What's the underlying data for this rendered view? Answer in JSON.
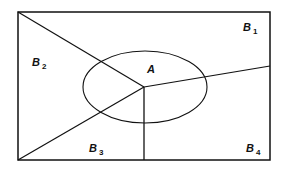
{
  "diagram": {
    "type": "venn-partition",
    "stroke_color": "#111111",
    "background": "#ffffff",
    "rectangle": {
      "x1": 18,
      "y1": 12,
      "x2": 270,
      "y2": 160
    },
    "ellipse": {
      "cx": 145,
      "cy": 87,
      "rx": 62,
      "ry": 36
    },
    "center_point": {
      "x": 144,
      "y": 87
    },
    "partition_lines": [
      {
        "name": "B1-B2 boundary",
        "from": [
          144,
          87
        ],
        "to": [
          18,
          12
        ]
      },
      {
        "name": "B2-B3 boundary",
        "from": [
          144,
          87
        ],
        "to": [
          18,
          160
        ]
      },
      {
        "name": "B3-B4 boundary",
        "from": [
          144,
          87
        ],
        "to": [
          144,
          160
        ]
      },
      {
        "name": "B4-B1 boundary",
        "from": [
          144,
          87
        ],
        "to": [
          270,
          66
        ]
      }
    ],
    "labels": {
      "A": {
        "text": "A",
        "x": 147,
        "y": 64
      },
      "B1": {
        "text": "B",
        "sub": "1",
        "x": 243,
        "y": 22
      },
      "B2": {
        "text": "B",
        "sub": "2",
        "x": 32,
        "y": 57
      },
      "B3": {
        "text": "B",
        "sub": "3",
        "x": 89,
        "y": 143
      },
      "B4": {
        "text": "B",
        "sub": "4",
        "x": 246,
        "y": 143
      }
    }
  }
}
